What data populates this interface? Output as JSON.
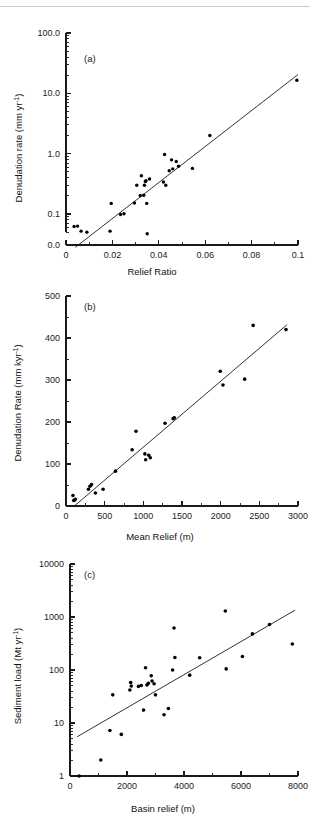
{
  "page": {
    "background_color": "#ffffff",
    "rule_color": "#c9c9c9",
    "ink_color": "#1a1a1a"
  },
  "chart_data": [
    {
      "id": "a",
      "panel_label": "(a)",
      "type": "scatter",
      "title": "",
      "xlabel": "Relief Ratio",
      "ylabel": "Denudation rate (mm yr⁻¹)",
      "xscale": "linear",
      "yscale": "log",
      "xlim": [
        0,
        0.1
      ],
      "ylim": [
        0.02,
        100.0
      ],
      "xticks": [
        0,
        0.02,
        0.04,
        0.06,
        0.08,
        0.1
      ],
      "xticklabels": [
        "0",
        "0.02",
        "0.04",
        "0.06",
        "0.08",
        "0.1"
      ],
      "xminor_step": 0.01,
      "yticks": [
        0.1,
        1.0,
        10.0,
        100.0
      ],
      "yticklabels": [
        "0.1",
        "1.0",
        "10.0",
        "100.0"
      ],
      "extra_ytick": {
        "value": 0.0,
        "label": "0.0"
      },
      "grid": false,
      "legend": null,
      "points": [
        [
          0.0035,
          0.062
        ],
        [
          0.005,
          0.063
        ],
        [
          0.0065,
          0.052
        ],
        [
          0.009,
          0.05
        ],
        [
          0.019,
          0.052
        ],
        [
          0.0195,
          0.15
        ],
        [
          0.0235,
          0.098
        ],
        [
          0.025,
          0.101
        ],
        [
          0.0295,
          0.152
        ],
        [
          0.0305,
          0.3
        ],
        [
          0.032,
          0.203
        ],
        [
          0.0325,
          0.43
        ],
        [
          0.0335,
          0.205
        ],
        [
          0.0338,
          0.3
        ],
        [
          0.0342,
          0.345
        ],
        [
          0.0345,
          0.355
        ],
        [
          0.0348,
          0.15
        ],
        [
          0.035,
          0.047
        ],
        [
          0.036,
          0.38
        ],
        [
          0.042,
          0.34
        ],
        [
          0.0425,
          0.97
        ],
        [
          0.043,
          0.3
        ],
        [
          0.0445,
          0.52
        ],
        [
          0.0455,
          0.79
        ],
        [
          0.046,
          0.56
        ],
        [
          0.0475,
          0.74
        ],
        [
          0.0485,
          0.62
        ],
        [
          0.0545,
          0.57
        ],
        [
          0.062,
          2.0
        ],
        [
          0.0995,
          16.5
        ]
      ],
      "fit_line": {
        "x": [
          0.004,
          0.1
        ],
        "y": [
          0.028,
          20.5
        ]
      }
    },
    {
      "id": "b",
      "panel_label": "(b)",
      "type": "scatter",
      "title": "",
      "xlabel": "Mean Relief (m)",
      "ylabel": "Denudation Rate (mm kyr⁻¹)",
      "xscale": "linear",
      "yscale": "linear",
      "xlim": [
        0,
        3000
      ],
      "ylim": [
        0,
        500
      ],
      "xticks": [
        0,
        500,
        1000,
        1500,
        2000,
        2500,
        3000
      ],
      "xticklabels": [
        "0",
        "500",
        "1000",
        "1500",
        "2000",
        "2500",
        "3000"
      ],
      "xminor_step": 250,
      "yticks": [
        0,
        100,
        200,
        300,
        400,
        500
      ],
      "yticklabels": [
        "0",
        "100",
        "200",
        "300",
        "400",
        "500"
      ],
      "yminor_step": 50,
      "grid": false,
      "legend": null,
      "points": [
        [
          90,
          25
        ],
        [
          100,
          13
        ],
        [
          110,
          14
        ],
        [
          120,
          16
        ],
        [
          290,
          40
        ],
        [
          310,
          47
        ],
        [
          330,
          51
        ],
        [
          380,
          31
        ],
        [
          480,
          40
        ],
        [
          640,
          83
        ],
        [
          855,
          134
        ],
        [
          905,
          178
        ],
        [
          1020,
          124
        ],
        [
          1030,
          110
        ],
        [
          1070,
          121
        ],
        [
          1090,
          115
        ],
        [
          1280,
          197
        ],
        [
          1385,
          208
        ],
        [
          1400,
          210
        ],
        [
          1995,
          321
        ],
        [
          2030,
          288
        ],
        [
          2310,
          302
        ],
        [
          2420,
          430
        ],
        [
          2845,
          420
        ]
      ],
      "fit_line": {
        "x": [
          95,
          2860
        ],
        "y": [
          -2,
          432
        ]
      }
    },
    {
      "id": "c",
      "panel_label": "(c)",
      "type": "scatter",
      "title": "",
      "xlabel": "Basin relief (m)",
      "ylabel": "Sediment load (Mt yr⁻¹)",
      "xscale": "linear",
      "yscale": "log",
      "xlim": [
        0,
        8000
      ],
      "ylim": [
        1,
        10000
      ],
      "xticks": [
        0,
        2000,
        4000,
        6000,
        8000
      ],
      "xticklabels": [
        "0",
        "2000",
        "4000",
        "6000",
        "8000"
      ],
      "xminor_step": 1000,
      "yticks": [
        1,
        10,
        100,
        1000,
        10000
      ],
      "yticklabels": [
        "1",
        "10",
        "100",
        "1000",
        "10000"
      ],
      "grid": false,
      "legend": null,
      "points": [
        [
          320,
          1.0
        ],
        [
          1080,
          2.0
        ],
        [
          1400,
          7.2
        ],
        [
          1500,
          34
        ],
        [
          1800,
          6.1
        ],
        [
          2100,
          42
        ],
        [
          2130,
          58
        ],
        [
          2150,
          50
        ],
        [
          2400,
          49
        ],
        [
          2500,
          51
        ],
        [
          2580,
          17.5
        ],
        [
          2650,
          110
        ],
        [
          2700,
          52
        ],
        [
          2750,
          56
        ],
        [
          2850,
          78
        ],
        [
          2880,
          62
        ],
        [
          2950,
          55
        ],
        [
          3000,
          34
        ],
        [
          3300,
          14.3
        ],
        [
          3450,
          18.8
        ],
        [
          3600,
          100
        ],
        [
          3650,
          620
        ],
        [
          3680,
          172
        ],
        [
          4200,
          80
        ],
        [
          4550,
          170
        ],
        [
          5450,
          1300
        ],
        [
          5480,
          105
        ],
        [
          6050,
          180
        ],
        [
          6400,
          480
        ],
        [
          7000,
          720
        ],
        [
          7800,
          310
        ]
      ],
      "fit_line": {
        "x": [
          250,
          7900
        ],
        "y": [
          5.5,
          1350
        ]
      }
    }
  ]
}
